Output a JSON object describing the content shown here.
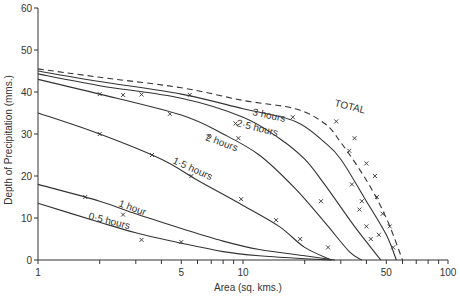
{
  "chart_data": {
    "type": "line",
    "title": "",
    "xlabel": "Area (sq. kms.)",
    "ylabel": "Depth of Precipitation (mms.)",
    "xscale": "log",
    "xlim": [
      1,
      100
    ],
    "ylim": [
      0,
      60
    ],
    "grid": false,
    "legend": "inline labels on curves",
    "x_tick_labels": [
      "1",
      "5",
      "10",
      "50",
      "100"
    ],
    "y_tick_labels": [
      "0",
      "10",
      "20",
      "30",
      "40",
      "50",
      "60"
    ],
    "series": [
      {
        "name": "TOTAL",
        "style": "dashed",
        "points": [
          [
            1,
            45.5
          ],
          [
            2,
            43.5
          ],
          [
            5,
            41
          ],
          [
            10,
            38
          ],
          [
            18,
            36
          ],
          [
            25,
            32.5
          ],
          [
            30,
            28
          ],
          [
            40,
            19
          ],
          [
            50,
            10
          ],
          [
            60,
            0
          ]
        ]
      },
      {
        "name": "3 hours",
        "style": "solid",
        "points": [
          [
            1,
            45
          ],
          [
            2,
            42.5
          ],
          [
            5,
            39.5
          ],
          [
            10,
            36
          ],
          [
            18,
            33
          ],
          [
            25,
            28
          ],
          [
            30,
            24
          ],
          [
            40,
            14
          ],
          [
            50,
            6
          ],
          [
            56,
            0
          ]
        ]
      },
      {
        "name": "2.5 hours",
        "style": "solid",
        "points": [
          [
            1,
            44.3
          ],
          [
            2,
            41.5
          ],
          [
            5,
            38.5
          ],
          [
            10,
            34
          ],
          [
            15,
            29
          ],
          [
            20,
            24
          ],
          [
            25,
            18
          ],
          [
            35,
            8
          ],
          [
            47,
            0
          ]
        ]
      },
      {
        "name": "2 hours",
        "style": "solid",
        "points": [
          [
            1,
            43
          ],
          [
            2,
            39.5
          ],
          [
            5,
            34.5
          ],
          [
            8,
            30
          ],
          [
            12,
            25
          ],
          [
            18,
            17
          ],
          [
            25,
            9
          ],
          [
            33,
            2
          ],
          [
            38,
            0
          ]
        ]
      },
      {
        "name": "1.5 hours",
        "style": "solid",
        "points": [
          [
            1,
            35
          ],
          [
            2,
            30
          ],
          [
            4,
            24
          ],
          [
            6,
            19
          ],
          [
            10,
            13
          ],
          [
            15,
            8
          ],
          [
            20,
            3
          ],
          [
            27,
            0
          ]
        ]
      },
      {
        "name": "1 hour",
        "style": "solid",
        "points": [
          [
            1,
            18
          ],
          [
            2,
            14
          ],
          [
            3,
            11
          ],
          [
            5,
            7.5
          ],
          [
            8,
            4.5
          ],
          [
            12,
            2.5
          ],
          [
            20,
            1
          ],
          [
            28,
            0
          ]
        ]
      },
      {
        "name": "0.5 hours",
        "style": "solid",
        "points": [
          [
            1,
            13.5
          ],
          [
            2,
            9
          ],
          [
            3,
            6.5
          ],
          [
            5,
            4
          ],
          [
            8,
            2
          ],
          [
            12,
            1
          ],
          [
            20,
            0.3
          ],
          [
            27,
            0
          ]
        ]
      }
    ],
    "observed_points_marker": "x",
    "observed_points": [
      [
        2.0,
        39.5
      ],
      [
        2.6,
        39.3
      ],
      [
        3.2,
        39.4
      ],
      [
        5.5,
        39.3
      ],
      [
        4.4,
        34.8
      ],
      [
        9.2,
        32.5
      ],
      [
        6.8,
        29.5
      ],
      [
        17.5,
        34
      ],
      [
        28.5,
        33
      ],
      [
        9.5,
        29
      ],
      [
        2.0,
        30
      ],
      [
        3.6,
        25
      ],
      [
        5.6,
        20
      ],
      [
        9.8,
        14.5
      ],
      [
        14.5,
        9.5
      ],
      [
        19,
        5
      ],
      [
        1.7,
        15
      ],
      [
        2.6,
        10.8
      ],
      [
        5.0,
        4.3
      ],
      [
        3.2,
        4.8
      ],
      [
        33,
        26
      ],
      [
        34,
        18
      ],
      [
        37,
        12
      ],
      [
        40,
        8
      ],
      [
        24,
        14
      ],
      [
        26,
        3
      ],
      [
        35,
        29
      ],
      [
        40,
        23
      ],
      [
        44,
        20
      ],
      [
        38,
        14
      ],
      [
        45,
        15
      ],
      [
        48,
        11
      ],
      [
        46,
        6
      ],
      [
        52,
        8
      ],
      [
        42,
        5
      ],
      [
        54,
        3
      ]
    ]
  },
  "labels": {
    "x_axis": "Area  (sq. kms.)",
    "y_axis": "Depth  of  Precipitation  (mms.)",
    "curve_total": "TOTAL",
    "curve_3h": "3 hours",
    "curve_25h": "2·5 hours",
    "curve_2h": "2 hours",
    "curve_15h": "1·5 hours",
    "curve_1h": "1 hour",
    "curve_05h": "0·5 hours"
  },
  "colors": {
    "line": "#333333",
    "background": "#ffffff"
  }
}
